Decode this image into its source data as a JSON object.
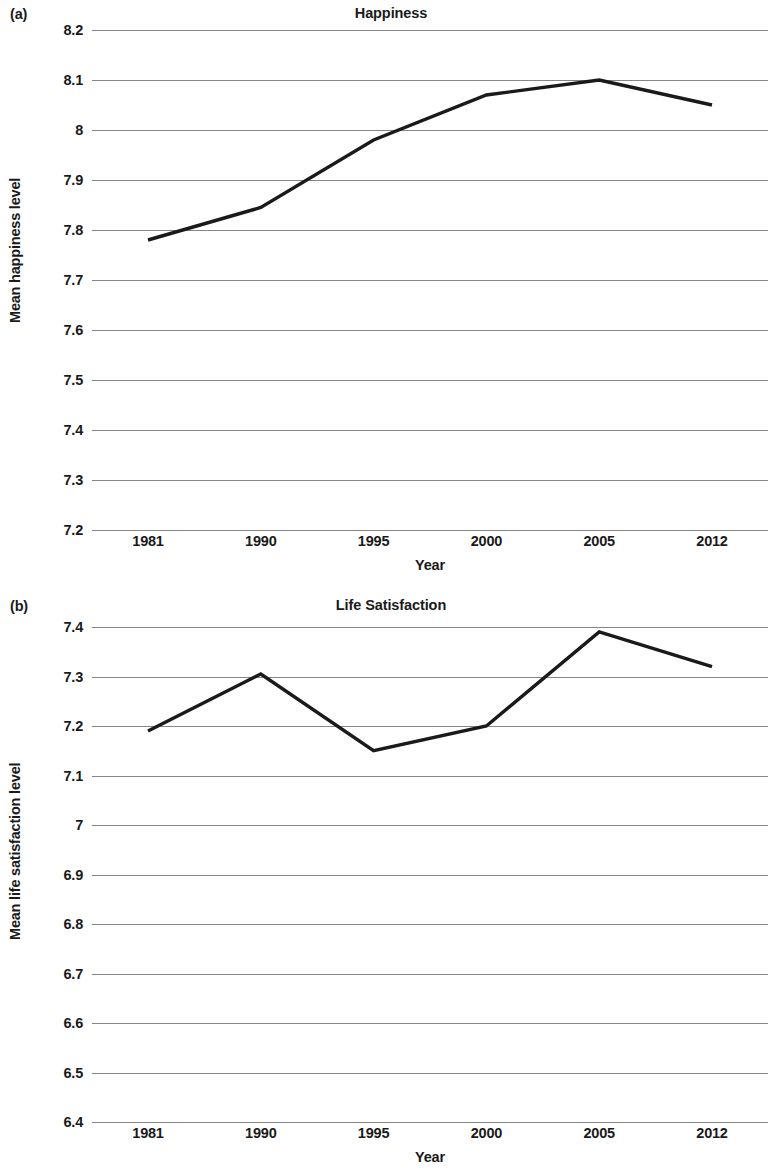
{
  "figure": {
    "background": "#ffffff",
    "line_color": "#1a1a1a",
    "grid_color": "#868686"
  },
  "panels": [
    {
      "panel_label": "(a)",
      "title": "Happiness",
      "ylabel": "Mean happiness level",
      "xlabel": "Year"
    },
    {
      "panel_label": "(b)",
      "title": "Life Satisfaction",
      "ylabel": "Mean life satisfaction level",
      "xlabel": "Year"
    }
  ],
  "chart_data": [
    {
      "type": "line",
      "title": "Happiness",
      "panel": "(a)",
      "xlabel": "Year",
      "ylabel": "Mean happiness level",
      "categories": [
        "1981",
        "1990",
        "1995",
        "2000",
        "2005",
        "2012"
      ],
      "x": [
        1981,
        1990,
        1995,
        2000,
        2005,
        2012
      ],
      "values": [
        7.78,
        7.845,
        7.98,
        8.07,
        8.1,
        8.05
      ],
      "ylim": [
        7.2,
        8.2
      ],
      "ytick_labels": [
        "8.2",
        "8.1",
        "8",
        "7.9",
        "7.8",
        "7.7",
        "7.6",
        "7.5",
        "7.4",
        "7.3",
        "7.2"
      ],
      "ytick_values": [
        8.2,
        8.1,
        8.0,
        7.9,
        7.8,
        7.7,
        7.6,
        7.5,
        7.4,
        7.3,
        7.2
      ],
      "grid": true,
      "legend": false,
      "markers": false
    },
    {
      "type": "line",
      "title": "Life Satisfaction",
      "panel": "(b)",
      "xlabel": "Year",
      "ylabel": "Mean life satisfaction level",
      "categories": [
        "1981",
        "1990",
        "1995",
        "2000",
        "2005",
        "2012"
      ],
      "x": [
        1981,
        1990,
        1995,
        2000,
        2005,
        2012
      ],
      "values": [
        7.19,
        7.305,
        7.15,
        7.2,
        7.39,
        7.32
      ],
      "ylim": [
        6.4,
        7.4
      ],
      "ytick_labels": [
        "7.4",
        "7.3",
        "7.2",
        "7.1",
        "7",
        "6.9",
        "6.8",
        "6.7",
        "6.6",
        "6.5",
        "6.4"
      ],
      "ytick_values": [
        7.4,
        7.3,
        7.2,
        7.1,
        7.0,
        6.9,
        6.8,
        6.7,
        6.6,
        6.5,
        6.4
      ],
      "grid": true,
      "legend": false,
      "markers": false
    }
  ]
}
